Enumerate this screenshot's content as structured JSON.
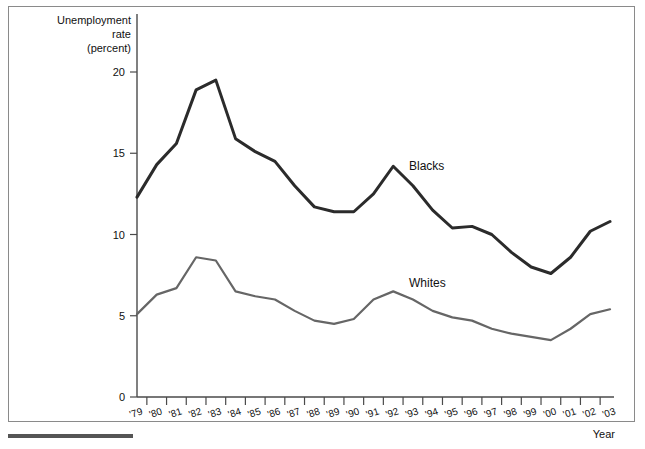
{
  "figure": {
    "frame_border_color": "#8a8a8a",
    "background": "#ffffff",
    "footer_rule_color": "#555555"
  },
  "axis_titles": {
    "y_line1": "Unemployment",
    "y_line2": "rate",
    "y_line3": "(percent)",
    "x": "Year"
  },
  "series_labels": {
    "blacks": "Blacks",
    "whites": "Whites"
  },
  "chart_data": {
    "type": "line",
    "title": "",
    "xlabel": "Year",
    "ylabel": "Unemployment rate (percent)",
    "ylim": [
      0,
      21
    ],
    "yticks": [
      0,
      5,
      10,
      15,
      20
    ],
    "ytick_labels": [
      "0",
      "5",
      "10",
      "15",
      "20"
    ],
    "grid": false,
    "legend": "inline-labels",
    "categories": [
      "'79",
      "'80",
      "'81",
      "'82",
      "'83",
      "'84",
      "'85",
      "'86",
      "'87",
      "'88",
      "'89",
      "'90",
      "'91",
      "'92",
      "'93",
      "'94",
      "'95",
      "'96",
      "'97",
      "'98",
      "'99",
      "'00",
      "'01",
      "'02",
      "'03"
    ],
    "x": [
      1979,
      1980,
      1981,
      1982,
      1983,
      1984,
      1985,
      1986,
      1987,
      1988,
      1989,
      1990,
      1991,
      1992,
      1993,
      1994,
      1995,
      1996,
      1997,
      1998,
      1999,
      2000,
      2001,
      2002,
      2003
    ],
    "series": [
      {
        "name": "Blacks",
        "color": "#2b2b2b",
        "width": 3.0,
        "values": [
          12.3,
          14.3,
          15.6,
          18.9,
          19.5,
          15.9,
          15.1,
          14.5,
          13.0,
          11.7,
          11.4,
          11.4,
          12.5,
          14.2,
          13.0,
          11.5,
          10.4,
          10.5,
          10.0,
          8.9,
          8.0,
          7.6,
          8.6,
          10.2,
          10.8
        ]
      },
      {
        "name": "Whites",
        "color": "#666666",
        "width": 2.2,
        "values": [
          5.1,
          6.3,
          6.7,
          8.6,
          8.4,
          6.5,
          6.2,
          6.0,
          5.3,
          4.7,
          4.5,
          4.8,
          6.0,
          6.5,
          6.0,
          5.3,
          4.9,
          4.7,
          4.2,
          3.9,
          3.7,
          3.5,
          4.2,
          5.1,
          5.4
        ]
      }
    ],
    "annotations": [
      {
        "text": "Blacks",
        "x": 1992.8,
        "y": 14.0
      },
      {
        "text": "Whites",
        "x": 1992.8,
        "y": 6.8
      }
    ]
  }
}
